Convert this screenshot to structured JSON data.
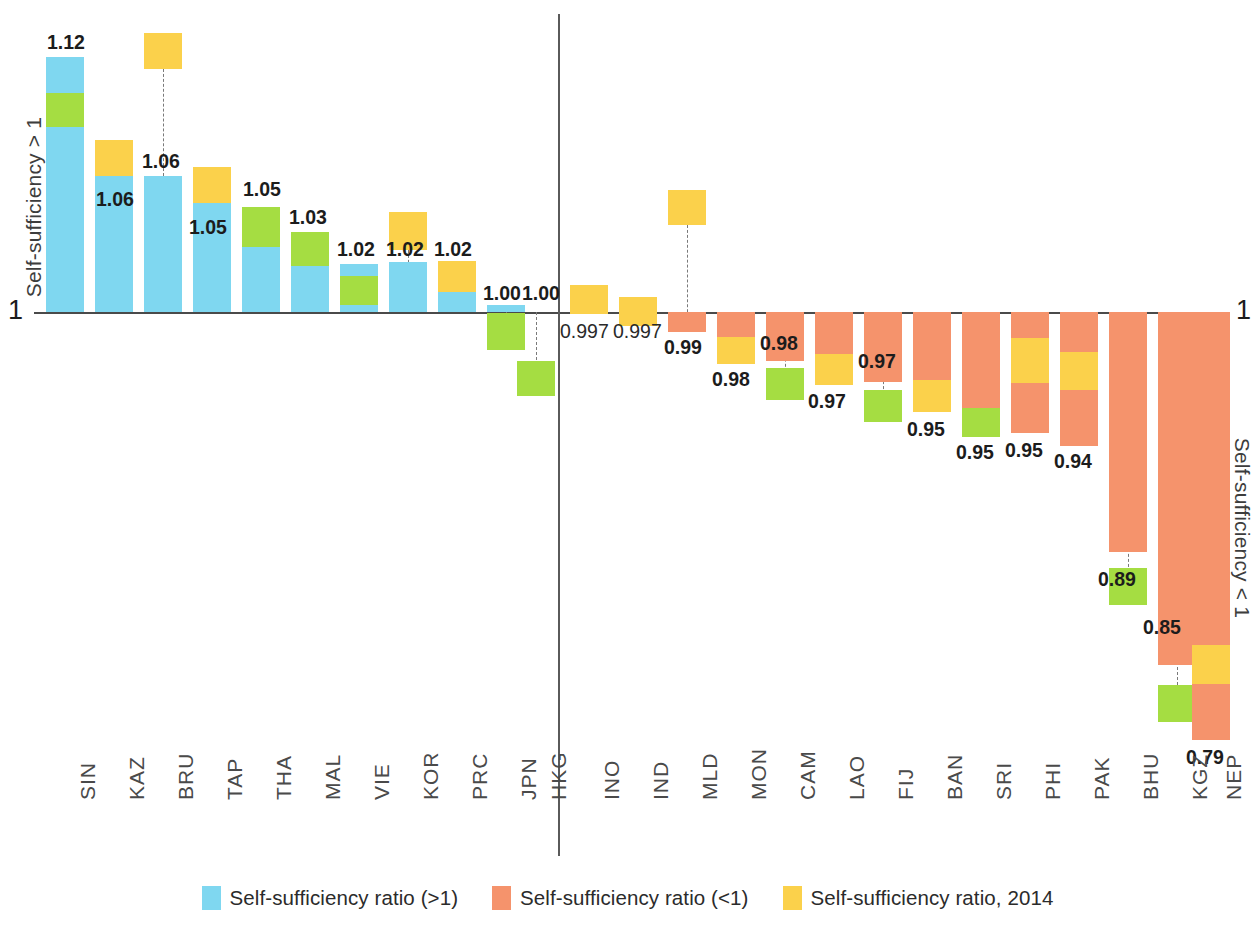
{
  "axis": {
    "left_label": "Self-sufficiency > 1",
    "right_label": "Self-sufficiency < 1",
    "baseline_value_left": "1",
    "baseline_value_right": "1"
  },
  "legend": {
    "items": [
      {
        "label": "Self-sufficiency ratio (>1)",
        "color": "#7fd7f0",
        "icon": "blue-square-swatch"
      },
      {
        "label": "Self-sufficiency ratio (<1)",
        "color": "#f5936c",
        "icon": "orange-square-swatch"
      },
      {
        "label": "Self-sufficiency ratio, 2014",
        "color": "#fbd14b",
        "icon": "yellow-square-swatch"
      }
    ]
  },
  "chart_data": {
    "type": "bar",
    "title": "",
    "subtitle": "",
    "xlabel": "",
    "ylabel": "Self-sufficiency ratio",
    "baseline": 1.0,
    "grid": false,
    "legend_position": "bottom",
    "axis_left_label": "Self-sufficiency > 1",
    "axis_right_label": "Self-sufficiency < 1",
    "categories": [
      "SIN",
      "KAZ",
      "BRU",
      "TAP",
      "THA",
      "MAL",
      "VIE",
      "KOR",
      "PRC",
      "JPN",
      "HKG",
      "INO",
      "IND",
      "MLD",
      "MON",
      "CAM",
      "LAO",
      "FIJ",
      "BAN",
      "SRI",
      "PHI",
      "PAK",
      "BHU",
      "KGZ",
      "NEP"
    ],
    "values": [
      1.12,
      1.06,
      1.06,
      1.05,
      1.05,
      1.03,
      1.02,
      1.02,
      1.02,
      1.0,
      1.0,
      0.997,
      0.997,
      0.99,
      0.98,
      0.98,
      0.97,
      0.97,
      0.95,
      0.95,
      0.95,
      0.94,
      0.89,
      0.85,
      0.79
    ],
    "value_labels": [
      "1.12",
      "1.06",
      "1.06",
      "1.05",
      "1.05",
      "1.03",
      "1.02",
      "1.02",
      "1.02",
      "1.00",
      "1.00",
      "0.997",
      "0.997",
      "0.99",
      "0.98",
      "0.98",
      "0.97",
      "0.97",
      "0.95",
      "0.95",
      "0.95",
      "0.94",
      "0.89",
      "0.85",
      "0.79"
    ],
    "series": [
      {
        "name": "Self-sufficiency ratio (>1)",
        "color": "#7fd7f0",
        "values": [
          1.12,
          1.06,
          1.06,
          1.05,
          1.05,
          1.03,
          1.02,
          1.02,
          1.02,
          1.0,
          null,
          null,
          null,
          null,
          null,
          null,
          null,
          null,
          null,
          null,
          null,
          null,
          null,
          null,
          null
        ]
      },
      {
        "name": "Self-sufficiency ratio (<1)",
        "color": "#f5936c",
        "values": [
          null,
          null,
          null,
          null,
          null,
          null,
          null,
          null,
          null,
          null,
          null,
          0.997,
          0.997,
          0.99,
          0.98,
          0.98,
          0.97,
          0.97,
          0.95,
          0.95,
          0.95,
          0.94,
          0.89,
          0.85,
          0.79
        ]
      },
      {
        "name": "Self-sufficiency ratio, 2014",
        "color": "#fbd14b",
        "values": [
          null,
          1.09,
          1.17,
          1.08,
          null,
          null,
          null,
          1.05,
          1.02,
          null,
          null,
          1.004,
          1.002,
          1.04,
          0.985,
          0.98,
          0.975,
          0.975,
          0.955,
          0.96,
          0.965,
          0.955,
          null,
          null,
          0.81
        ]
      }
    ],
    "bars": [
      {
        "cat": "SIN",
        "label": "1.12",
        "side": "above",
        "main_color": "#7fd7f0",
        "green": true,
        "yellow_detached": false
      },
      {
        "cat": "KAZ",
        "label": "1.06",
        "side": "above",
        "main_color": "#7fd7f0",
        "green": false,
        "yellow_detached": true
      },
      {
        "cat": "BRU",
        "label": "1.06",
        "side": "above",
        "main_color": "#7fd7f0",
        "green": false,
        "yellow_detached": true
      },
      {
        "cat": "TAP",
        "label": "1.05",
        "side": "above",
        "main_color": "#7fd7f0",
        "green": false,
        "yellow_detached": true
      },
      {
        "cat": "THA",
        "label": "1.05",
        "side": "above",
        "main_color": "#7fd7f0",
        "green": true,
        "yellow_detached": false
      },
      {
        "cat": "MAL",
        "label": "1.03",
        "side": "above",
        "main_color": "#7fd7f0",
        "green": true,
        "yellow_detached": false
      },
      {
        "cat": "VIE",
        "label": "1.02",
        "side": "above",
        "main_color": "#7fd7f0",
        "green": true,
        "yellow_detached": false
      },
      {
        "cat": "KOR",
        "label": "1.02",
        "side": "above",
        "main_color": "#7fd7f0",
        "green": false,
        "yellow_detached": true
      },
      {
        "cat": "PRC",
        "label": "1.02",
        "side": "above",
        "main_color": "#7fd7f0",
        "green": false,
        "yellow_detached": false
      },
      {
        "cat": "JPN",
        "label": "1.00",
        "side": "above",
        "main_color": "#7fd7f0",
        "green": true,
        "yellow_detached": false
      },
      {
        "cat": "HKG",
        "label": "1.00",
        "side": "below",
        "main_color": "#7fd7f0",
        "green": true,
        "yellow_detached": false
      },
      {
        "cat": "INO",
        "label": "0.997",
        "side": "below",
        "main_color": "#f5936c",
        "green": false,
        "yellow_detached": false
      },
      {
        "cat": "IND",
        "label": "0.997",
        "side": "below",
        "main_color": "#f5936c",
        "green": false,
        "yellow_detached": false
      },
      {
        "cat": "MLD",
        "label": "0.99",
        "side": "below",
        "main_color": "#f5936c",
        "green": false,
        "yellow_detached": true
      },
      {
        "cat": "MON",
        "label": "0.98",
        "side": "below",
        "main_color": "#f5936c",
        "green": false,
        "yellow_detached": false
      },
      {
        "cat": "CAM",
        "label": "0.98",
        "side": "below",
        "main_color": "#f5936c",
        "green": true,
        "yellow_detached": false
      },
      {
        "cat": "LAO",
        "label": "0.97",
        "side": "below",
        "main_color": "#f5936c",
        "green": false,
        "yellow_detached": false
      },
      {
        "cat": "FIJ",
        "label": "0.97",
        "side": "below",
        "main_color": "#f5936c",
        "green": true,
        "yellow_detached": false
      },
      {
        "cat": "BAN",
        "label": "0.95",
        "side": "below",
        "main_color": "#f5936c",
        "green": false,
        "yellow_detached": false
      },
      {
        "cat": "SRI",
        "label": "0.95",
        "side": "below",
        "main_color": "#f5936c",
        "green": true,
        "yellow_detached": false
      },
      {
        "cat": "PHI",
        "label": "0.95",
        "side": "below",
        "main_color": "#f5936c",
        "green": false,
        "yellow_detached": false
      },
      {
        "cat": "PAK",
        "label": "0.94",
        "side": "below",
        "main_color": "#f5936c",
        "green": false,
        "yellow_detached": false
      },
      {
        "cat": "BHU",
        "label": "0.89",
        "side": "below",
        "main_color": "#f5936c",
        "green": true,
        "yellow_detached": false
      },
      {
        "cat": "KGZ",
        "label": "0.85",
        "side": "below",
        "main_color": "#f5936c",
        "green": true,
        "yellow_detached": false
      },
      {
        "cat": "NEP",
        "label": "0.79",
        "side": "below",
        "main_color": "#f5936c",
        "green": false,
        "yellow_detached": false
      }
    ]
  },
  "geometry": {
    "baseline_y": 312,
    "bars": [
      {
        "x": 46,
        "w": 38,
        "main_top": 57,
        "main_bot": 312,
        "green_top": 93,
        "green_bot": 127,
        "yellow_top": null,
        "yellow_bot": null,
        "leader_top": 93,
        "leader_bot": 312,
        "label_x": 47,
        "label_y": 33
      },
      {
        "x": 95,
        "w": 38,
        "main_top": 176,
        "main_bot": 312,
        "green_top": null,
        "green_bot": null,
        "yellow_top": 140,
        "yellow_bot": 176,
        "leader_top": 176,
        "leader_bot": 312,
        "label_x": 96,
        "label_y": 190
      },
      {
        "x": 144,
        "w": 38,
        "main_top": 176,
        "main_bot": 312,
        "green_top": null,
        "green_bot": null,
        "yellow_top": 33,
        "yellow_bot": 69,
        "leader_top": 69,
        "leader_bot": 176,
        "label_x": 142,
        "label_y": 152
      },
      {
        "x": 193,
        "w": 38,
        "main_top": 203,
        "main_bot": 312,
        "green_top": null,
        "green_bot": null,
        "yellow_top": 167,
        "yellow_bot": 203,
        "leader_top": 203,
        "leader_bot": 312,
        "label_x": 189,
        "label_y": 218
      },
      {
        "x": 242,
        "w": 38,
        "main_top": 207,
        "main_bot": 312,
        "green_top": 207,
        "green_bot": 247,
        "yellow_top": null,
        "yellow_bot": null,
        "leader_top": 247,
        "leader_bot": 312,
        "label_x": 243,
        "label_y": 180
      },
      {
        "x": 291,
        "w": 38,
        "main_top": 232,
        "main_bot": 312,
        "green_top": 232,
        "green_bot": 266,
        "yellow_top": null,
        "yellow_bot": null,
        "leader_top": 266,
        "leader_bot": 312,
        "label_x": 289,
        "label_y": 208
      },
      {
        "x": 340,
        "w": 38,
        "main_top": 264,
        "main_bot": 312,
        "green_top": 276,
        "green_bot": 305,
        "yellow_top": null,
        "yellow_bot": null,
        "leader_top": 276,
        "leader_bot": 312,
        "label_x": 337,
        "label_y": 240
      },
      {
        "x": 389,
        "w": 38,
        "main_top": 262,
        "main_bot": 312,
        "green_top": null,
        "green_bot": null,
        "yellow_top": 212,
        "yellow_bot": 250,
        "leader_top": 250,
        "leader_bot": 312,
        "label_x": 386,
        "label_y": 240
      },
      {
        "x": 438,
        "w": 38,
        "main_top": 261,
        "main_bot": 312,
        "green_top": null,
        "green_bot": null,
        "yellow_top": 261,
        "yellow_bot": 292,
        "leader_top": 292,
        "leader_bot": 312,
        "label_x": 434,
        "label_y": 240
      },
      {
        "x": 487,
        "w": 38,
        "main_top": 305,
        "main_bot": 312,
        "green_top": 313,
        "green_bot": 350,
        "yellow_top": null,
        "yellow_bot": null,
        "leader_top": 305,
        "leader_bot": 318,
        "label_x": 483,
        "label_y": 284
      },
      {
        "x": 517,
        "w": 38,
        "main_top": 312,
        "main_bot": 312,
        "green_top": 361,
        "green_bot": 396,
        "yellow_top": null,
        "yellow_bot": null,
        "leader_top": 312,
        "leader_bot": 365,
        "label_x": 522,
        "label_y": 284
      },
      {
        "x": 570,
        "w": 38,
        "main_top": 312,
        "main_bot": 314,
        "green_top": null,
        "green_bot": null,
        "yellow_top": 285,
        "yellow_bot": 314,
        "leader_top": 312,
        "leader_bot": 314,
        "label_x": 560,
        "label_y": 322
      },
      {
        "x": 619,
        "w": 38,
        "main_top": 312,
        "main_bot": 314,
        "green_top": null,
        "green_bot": null,
        "yellow_top": 297,
        "yellow_bot": 326,
        "leader_top": 312,
        "leader_bot": 320,
        "label_x": 613,
        "label_y": 322
      },
      {
        "x": 668,
        "w": 38,
        "main_top": 312,
        "main_bot": 332,
        "green_top": null,
        "green_bot": null,
        "yellow_top": 190,
        "yellow_bot": 225,
        "leader_top": 225,
        "leader_bot": 332,
        "label_x": 664,
        "label_y": 338
      },
      {
        "x": 717,
        "w": 38,
        "main_top": 312,
        "main_bot": 364,
        "green_top": null,
        "green_bot": null,
        "yellow_top": 337,
        "yellow_bot": 364,
        "leader_top": 312,
        "leader_bot": 337,
        "label_x": 712,
        "label_y": 370
      },
      {
        "x": 766,
        "w": 38,
        "main_top": 312,
        "main_bot": 361,
        "green_top": 368,
        "green_bot": 400,
        "yellow_top": null,
        "yellow_bot": null,
        "leader_top": 312,
        "leader_bot": 372,
        "label_x": 760,
        "label_y": 334
      },
      {
        "x": 815,
        "w": 38,
        "main_top": 312,
        "main_bot": 385,
        "green_top": null,
        "green_bot": null,
        "yellow_top": 354,
        "yellow_bot": 385,
        "leader_top": 312,
        "leader_bot": 356,
        "label_x": 808,
        "label_y": 392
      },
      {
        "x": 864,
        "w": 38,
        "main_top": 312,
        "main_bot": 382,
        "green_top": 390,
        "green_bot": 422,
        "yellow_top": null,
        "yellow_bot": null,
        "leader_top": 312,
        "leader_bot": 394,
        "label_x": 858,
        "label_y": 352
      },
      {
        "x": 913,
        "w": 38,
        "main_top": 312,
        "main_bot": 412,
        "green_top": null,
        "green_bot": null,
        "yellow_top": 380,
        "yellow_bot": 412,
        "leader_top": 312,
        "leader_bot": 382,
        "label_x": 907,
        "label_y": 420
      },
      {
        "x": 962,
        "w": 38,
        "main_top": 312,
        "main_bot": 408,
        "green_top": 408,
        "green_bot": 437,
        "yellow_top": null,
        "yellow_bot": null,
        "leader_top": 312,
        "leader_bot": 412,
        "label_x": 956,
        "label_y": 443
      },
      {
        "x": 1011,
        "w": 38,
        "main_top": 312,
        "main_bot": 433,
        "green_top": null,
        "green_bot": null,
        "yellow_top": 338,
        "yellow_bot": 383,
        "leader_top": 312,
        "leader_bot": 340,
        "label_x": 1005,
        "label_y": 441
      },
      {
        "x": 1060,
        "w": 38,
        "main_top": 312,
        "main_bot": 446,
        "green_top": null,
        "green_bot": null,
        "yellow_top": 352,
        "yellow_bot": 390,
        "leader_top": 312,
        "leader_bot": 355,
        "label_x": 1054,
        "label_y": 452
      },
      {
        "x": 1109,
        "w": 38,
        "main_top": 312,
        "main_bot": 552,
        "green_top": 568,
        "green_bot": 605,
        "yellow_top": null,
        "yellow_bot": null,
        "leader_top": 312,
        "leader_bot": 572,
        "label_x": 1098,
        "label_y": 570
      },
      {
        "x": 1158,
        "w": 38,
        "main_top": 312,
        "main_bot": 665,
        "green_top": 685,
        "green_bot": 722,
        "yellow_top": null,
        "yellow_bot": null,
        "leader_top": 312,
        "leader_bot": 690,
        "label_x": 1143,
        "label_y": 618
      },
      {
        "x": 1192,
        "w": 38,
        "main_top": 312,
        "main_bot": 740,
        "green_top": null,
        "green_bot": null,
        "yellow_top": 645,
        "yellow_bot": 684,
        "leader_top": 312,
        "leader_bot": 648,
        "label_x": 1186,
        "label_y": 748
      }
    ],
    "cat_x": [
      68,
      117,
      166,
      215,
      264,
      313,
      362,
      411,
      460,
      509,
      539,
      592,
      641,
      690,
      739,
      788,
      837,
      886,
      935,
      984,
      1033,
      1082,
      1131,
      1180,
      1214
    ]
  }
}
